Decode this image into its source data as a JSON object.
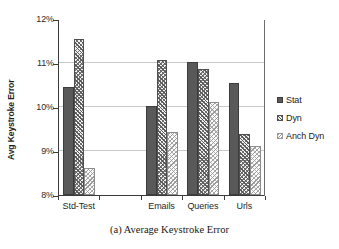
{
  "caption": "(a)  Average Keystroke Error",
  "legend": {
    "position": "right",
    "entries": [
      {
        "label": "Stat",
        "swatch": "stat"
      },
      {
        "label": "Dyn",
        "swatch": "dyn"
      },
      {
        "label": "Anch Dyn",
        "swatch": "anchdyn"
      }
    ]
  },
  "axes": {
    "ylabel": "Avg Keystroke Error",
    "yticks": [
      "8%",
      "9%",
      "10%",
      "11%",
      "12%"
    ],
    "xticks": [
      "Std-Test",
      "",
      "Emails",
      "Queries",
      "Urls"
    ]
  },
  "chart_data": {
    "type": "bar",
    "title": "",
    "caption": "(a)  Average Keystroke Error",
    "xlabel": "",
    "ylabel": "Avg Keystroke Error",
    "ylim": [
      8,
      12
    ],
    "yticks": [
      8,
      9,
      10,
      11,
      12
    ],
    "ytick_labels": [
      "8%",
      "9%",
      "10%",
      "11%",
      "12%"
    ],
    "units": "percent",
    "grid": true,
    "grid_axis": "y",
    "legend_position": "right",
    "categories": [
      "Std-Test",
      "",
      "Emails",
      "Queries",
      "Urls"
    ],
    "plotted_categories": [
      "Std-Test",
      "Emails",
      "Queries",
      "Urls"
    ],
    "series": [
      {
        "name": "Stat",
        "values": [
          10.45,
          null,
          10.02,
          11.02,
          10.55
        ]
      },
      {
        "name": "Dyn",
        "values": [
          11.55,
          null,
          11.07,
          10.87,
          9.38
        ]
      },
      {
        "name": "Anch Dyn",
        "values": [
          8.62,
          null,
          9.43,
          10.12,
          9.12
        ]
      }
    ]
  }
}
